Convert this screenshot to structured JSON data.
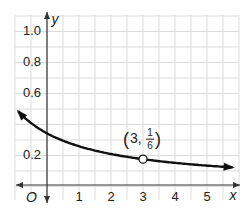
{
  "chart_data": {
    "type": "line",
    "title": "",
    "function": "y = 1/(x+3)",
    "xlabel": "x",
    "ylabel": "y",
    "origin_label": "O",
    "xlim": [
      -1,
      5.8
    ],
    "ylim": [
      -0.1,
      1.1
    ],
    "x_ticks": [
      1,
      2,
      3,
      4,
      5
    ],
    "x_tick_labels": [
      "1",
      "2",
      "3",
      "4",
      "5"
    ],
    "y_ticks": [
      0.2,
      0.6,
      0.8,
      1.0
    ],
    "y_tick_labels": [
      "0.2",
      "0.6",
      "0.8",
      "1.0"
    ],
    "grid": true,
    "series": [
      {
        "name": "curve",
        "x_start": -0.9,
        "x_end": 5.8,
        "color": "#111111",
        "arrows": "both"
      }
    ],
    "annotations": [
      {
        "x": 3,
        "y": 0.1667,
        "label_main": "3,",
        "label_num": "1",
        "label_den": "6",
        "marker": "open-circle"
      }
    ]
  }
}
